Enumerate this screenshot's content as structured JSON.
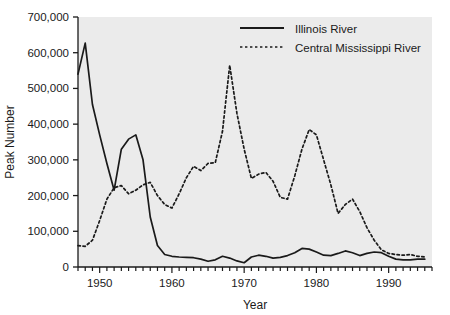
{
  "chart_data": {
    "type": "line",
    "title": "",
    "xlabel": "Year",
    "ylabel": "Peak Number",
    "xlim": [
      1947,
      1996
    ],
    "ylim": [
      0,
      700000
    ],
    "grid": false,
    "legend_position": "top-center",
    "x_ticks": [
      1950,
      1960,
      1970,
      1980,
      1990
    ],
    "x_tick_labels": [
      "1950",
      "1960",
      "1970",
      "1980",
      "1990"
    ],
    "x_minor_tick_step": 1,
    "y_ticks": [
      0,
      100000,
      200000,
      300000,
      400000,
      500000,
      600000,
      700000
    ],
    "y_tick_labels": [
      "0",
      "100,000",
      "200,000",
      "300,000",
      "400,000",
      "500,000",
      "600,000",
      "700,000"
    ],
    "plot_background": "#ebebeb",
    "figure_background": "#ffffff",
    "axis_color": "#1a1a1a",
    "series": [
      {
        "name": "Illinois River",
        "style": "solid",
        "color": "#1a1a1a",
        "x": [
          1947,
          1948,
          1949,
          1950,
          1951,
          1952,
          1953,
          1954,
          1955,
          1956,
          1957,
          1958,
          1959,
          1960,
          1961,
          1962,
          1963,
          1964,
          1965,
          1966,
          1967,
          1968,
          1969,
          1970,
          1971,
          1972,
          1973,
          1974,
          1975,
          1976,
          1977,
          1978,
          1979,
          1980,
          1981,
          1982,
          1983,
          1984,
          1985,
          1986,
          1987,
          1988,
          1989,
          1990,
          1991,
          1992,
          1993,
          1994,
          1995
        ],
        "values": [
          540000,
          627000,
          455000,
          370000,
          290000,
          215000,
          330000,
          358000,
          370000,
          300000,
          140000,
          60000,
          35000,
          30000,
          28000,
          27000,
          26000,
          22000,
          16000,
          20000,
          30000,
          25000,
          17000,
          12000,
          28000,
          33000,
          30000,
          25000,
          27000,
          32000,
          40000,
          52000,
          50000,
          42000,
          33000,
          32000,
          38000,
          45000,
          40000,
          32000,
          38000,
          42000,
          40000,
          30000,
          22000,
          20000,
          20000,
          22000,
          22000
        ]
      },
      {
        "name": "Central Mississippi River",
        "style": "dashed",
        "color": "#1a1a1a",
        "x": [
          1947,
          1948,
          1949,
          1950,
          1951,
          1952,
          1953,
          1954,
          1955,
          1956,
          1957,
          1958,
          1959,
          1960,
          1961,
          1962,
          1963,
          1964,
          1965,
          1966,
          1967,
          1968,
          1969,
          1970,
          1971,
          1972,
          1973,
          1974,
          1975,
          1976,
          1977,
          1978,
          1979,
          1980,
          1981,
          1982,
          1983,
          1984,
          1985,
          1986,
          1987,
          1988,
          1989,
          1990,
          1991,
          1992,
          1993,
          1994,
          1995
        ],
        "values": [
          60000,
          58000,
          75000,
          130000,
          190000,
          222000,
          228000,
          205000,
          215000,
          230000,
          237000,
          200000,
          175000,
          165000,
          205000,
          250000,
          282000,
          270000,
          290000,
          292000,
          380000,
          565000,
          430000,
          330000,
          248000,
          260000,
          265000,
          240000,
          195000,
          190000,
          255000,
          330000,
          385000,
          370000,
          300000,
          230000,
          150000,
          175000,
          190000,
          155000,
          110000,
          75000,
          48000,
          38000,
          35000,
          33000,
          35000,
          30000,
          28000
        ]
      }
    ]
  },
  "legend": {
    "items": [
      {
        "label": "Illinois River",
        "style": "solid"
      },
      {
        "label": "Central Mississippi River",
        "style": "dashed"
      }
    ]
  }
}
